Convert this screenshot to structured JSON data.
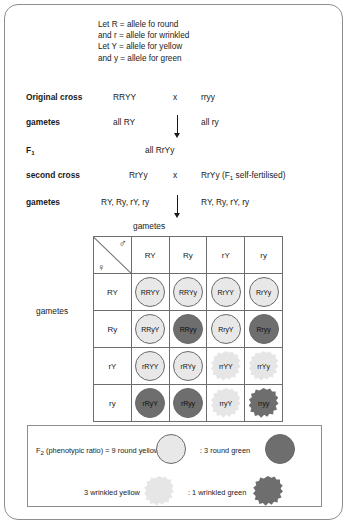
{
  "key_lines": [
    "Let R = allele fo round",
    "and r = allele for wrinkled",
    "Let Y = allele for yellow",
    "and y = allele for green"
  ],
  "crosses": {
    "original_label": "Original cross",
    "original_parent1": "RRYY",
    "cross_symbol": "x",
    "original_parent2": "rryy",
    "gametes_label_1": "gametes",
    "gametes_1_left": "all RY",
    "gametes_1_right": "all ry",
    "f1_label": "F",
    "f1_sub": "1",
    "f1_value": "all RrYy",
    "second_label": "second cross",
    "second_parent1": "RrYy",
    "second_parent2_pre": "RrYy (F",
    "second_parent2_sub": "1",
    "second_parent2_post": " self-fertilised)",
    "gametes_label_2": "gametes",
    "gametes_2_left": "RY, Ry, rY, ry",
    "gametes_2_right": "RY, Ry, rY, ry"
  },
  "grid": {
    "top_label": "gametes",
    "left_label": "gametes",
    "male_symbol": "♂",
    "female_symbol": "♀",
    "columns": [
      "RY",
      "Ry",
      "rY",
      "ry"
    ],
    "rows": [
      "RY",
      "Ry",
      "rY",
      "ry"
    ],
    "cells": [
      [
        {
          "text": "RRYY",
          "shape": "round",
          "shade": "light"
        },
        {
          "text": "RRYy",
          "shape": "round",
          "shade": "light"
        },
        {
          "text": "RrYY",
          "shape": "round",
          "shade": "light"
        },
        {
          "text": "RrYy",
          "shape": "round",
          "shade": "light"
        }
      ],
      [
        {
          "text": "RRyY",
          "shape": "round",
          "shade": "light"
        },
        {
          "text": "RRyy",
          "shape": "round",
          "shade": "dark"
        },
        {
          "text": "RryY",
          "shape": "round",
          "shade": "light"
        },
        {
          "text": "Rryy",
          "shape": "round",
          "shade": "dark"
        }
      ],
      [
        {
          "text": "rRYY",
          "shape": "round",
          "shade": "light"
        },
        {
          "text": "rRYy",
          "shape": "round",
          "shade": "light"
        },
        {
          "text": "rrYY",
          "shape": "wrinkled",
          "shade": "light"
        },
        {
          "text": "rrYy",
          "shape": "wrinkled",
          "shade": "light"
        }
      ],
      [
        {
          "text": "rRyY",
          "shape": "round",
          "shade": "dark"
        },
        {
          "text": "rRyy",
          "shape": "round",
          "shade": "dark"
        },
        {
          "text": "rryY",
          "shape": "wrinkled",
          "shade": "light"
        },
        {
          "text": "rryy",
          "shape": "wrinkled",
          "shade": "dark"
        }
      ]
    ]
  },
  "legend": {
    "ratio_prefix": "F",
    "ratio_sub": "2",
    "ratio_text": " (phenotypic ratio) = 9 round yellow",
    "round_green": ": 3 round green",
    "wrinkled_yellow": "3 wrinkled yellow",
    "wrinkled_green": ": 1 wrinkled green"
  },
  "colors": {
    "light_seed": "#e8e8e8",
    "dark_seed": "#6e6e6e",
    "border": "#8d8d8d",
    "grid_line": "#6d6d6d"
  }
}
